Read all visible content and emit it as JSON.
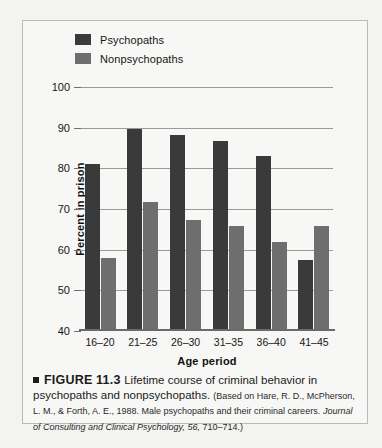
{
  "chart_data": {
    "type": "bar",
    "title": "",
    "xlabel": "Age period",
    "ylabel": "Percent in prison",
    "categories": [
      "16–20",
      "21–25",
      "26–30",
      "31–35",
      "36–40",
      "41–45"
    ],
    "ylim": [
      40,
      100
    ],
    "yticks": [
      40,
      50,
      60,
      70,
      80,
      90,
      100
    ],
    "grid": true,
    "legend_position": "top-left",
    "series": [
      {
        "name": "Psychopaths",
        "color": "#3a3a3a",
        "values": [
          81,
          89.5,
          88,
          86.5,
          83,
          57
        ]
      },
      {
        "name": "Nonpsychopaths",
        "color": "#6e6e6e",
        "values": [
          57.5,
          71.5,
          67,
          65.5,
          61.5,
          65.5
        ]
      }
    ]
  },
  "figure": {
    "marker": "■",
    "number": "FIGURE 11.3",
    "title": "Lifetime course of criminal behavior in psychopaths and nonpsychopaths.",
    "source_prefix": "(Based on Hare, R. D., McPherson, L. M., & Forth, A. E., 1988. Male psychopaths and their criminal careers.",
    "source_journal": "Journal of Consulting and Clinical Psychology, 56,",
    "source_pages": "710–714.)"
  }
}
